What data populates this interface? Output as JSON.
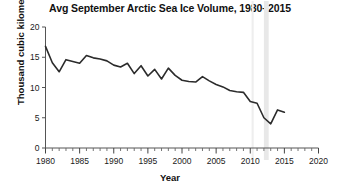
{
  "chart_data": {
    "type": "line",
    "title": "Avg September Arctic Sea Ice Volume, 1980–2015",
    "xlabel": "Year",
    "ylabel": "Thousand cubic kilometers",
    "xlim": [
      1980,
      2020
    ],
    "ylim": [
      0,
      20
    ],
    "xticks": [
      1980,
      1985,
      1990,
      1995,
      2000,
      2005,
      2010,
      2015,
      2020
    ],
    "xtick_labels": [
      "1980",
      "1985",
      "1990",
      "1995",
      "2000",
      "2005",
      "2010",
      "2015",
      "2020"
    ],
    "yticks": [
      0,
      5,
      10,
      15,
      20
    ],
    "ytick_labels": [
      "0",
      "5",
      "10",
      "15",
      "20"
    ],
    "minor_xtick_interval": 1,
    "grid": false,
    "legend": false,
    "line_color": "#2b2b2b",
    "line_width": 1.6,
    "x": [
      1980,
      1981,
      1982,
      1983,
      1984,
      1985,
      1986,
      1987,
      1988,
      1989,
      1990,
      1991,
      1992,
      1993,
      1994,
      1995,
      1996,
      1997,
      1998,
      1999,
      2000,
      2001,
      2002,
      2003,
      2004,
      2005,
      2006,
      2007,
      2008,
      2009,
      2010,
      2011,
      2012,
      2013,
      2014,
      2015
    ],
    "values": [
      16.8,
      14.1,
      12.6,
      14.6,
      14.3,
      14.0,
      15.3,
      14.9,
      14.7,
      14.4,
      13.7,
      13.4,
      14.0,
      12.3,
      13.6,
      11.9,
      13.0,
      11.4,
      13.2,
      12.0,
      11.2,
      11.0,
      10.9,
      11.8,
      11.1,
      10.5,
      10.1,
      9.5,
      9.3,
      9.2,
      7.7,
      7.4,
      5.0,
      4.0,
      6.3,
      5.9
    ],
    "shaded_bands": [
      {
        "x_start": 2010.2,
        "x_end": 2010.5,
        "color": "#eeeeee"
      },
      {
        "x_start": 2012.0,
        "x_end": 2012.7,
        "color": "#e8e8e8"
      }
    ]
  }
}
